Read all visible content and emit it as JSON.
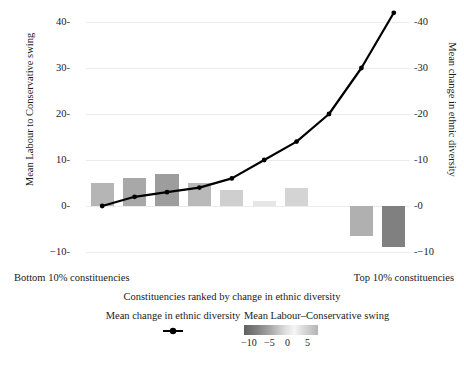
{
  "chart_data": {
    "type": "bar",
    "title": "",
    "subtitle": "",
    "xlabel": "Constituencies ranked by change in ethnic diversity",
    "categories": [
      "1",
      "2",
      "3",
      "4",
      "5",
      "6",
      "7",
      "8",
      "9",
      "10"
    ],
    "x_endpoint_low": "Bottom 10% constituencies",
    "x_endpoint_high": "Top 10% constituencies",
    "grid": true,
    "legend_position": "bottom",
    "axes": {
      "left": {
        "label": "Mean Labour to Conservative swing",
        "ticks": [
          "40",
          "30",
          "20",
          "10",
          "0",
          "−10"
        ],
        "tick_values": [
          40,
          30,
          20,
          10,
          0,
          -10
        ],
        "lim": [
          -10,
          40
        ]
      },
      "right": {
        "label": "Mean change in ethnic diversity",
        "ticks": [
          "40",
          "30",
          "20",
          "10",
          "0",
          "−10"
        ],
        "tick_values": [
          40,
          30,
          20,
          10,
          0,
          -10
        ],
        "lim": [
          -10,
          40
        ]
      }
    },
    "series": [
      {
        "name": "Mean Labour–Conservative swing",
        "type": "bar",
        "axis": "left",
        "values": [
          5.0,
          6.0,
          7.0,
          5.0,
          3.5,
          1.0,
          4.0,
          0.0,
          -6.5,
          -9.0
        ],
        "colors": [
          "#b5b5b5",
          "#a8a8a8",
          "#9d9d9d",
          "#b9b9b9",
          "#cfcfcf",
          "#e6e6e6",
          "#d4d4d4",
          "#ffffff",
          "#b0b0b0",
          "#808080"
        ]
      },
      {
        "name": "Mean change in ethnic diversity",
        "type": "line",
        "axis": "right",
        "values": [
          0.0,
          2.0,
          3.0,
          4.0,
          6.0,
          10.0,
          14.0,
          20.0,
          30.0,
          42.0
        ],
        "color": "#000000",
        "marker": "circle"
      }
    ],
    "colorbar": {
      "label": "Mean Labour–Conservative swing",
      "ticks": [
        "−10",
        "−5",
        "0",
        "5"
      ],
      "tick_values": [
        -10,
        -5,
        0,
        5
      ],
      "range": [
        -11,
        7
      ]
    }
  },
  "legend": {
    "line_entry_label": "Mean change in ethnic diversity",
    "line_marker_icon": "line-point-marker",
    "bar_entry_label": "Mean Labour–Conservative swing"
  }
}
